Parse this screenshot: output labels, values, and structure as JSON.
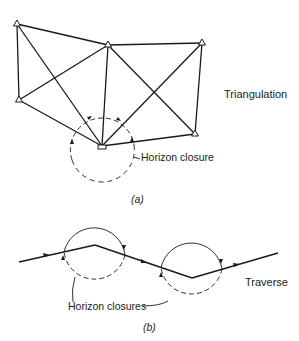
{
  "figure": {
    "part_a": {
      "caption": "(a)",
      "title": "Triangulation",
      "annotation": "Horizon closure",
      "stations": [
        {
          "id": "A",
          "x": 17,
          "y": 24
        },
        {
          "id": "B",
          "x": 108,
          "y": 45
        },
        {
          "id": "C",
          "x": 202,
          "y": 43
        },
        {
          "id": "D",
          "x": 19,
          "y": 100
        },
        {
          "id": "E",
          "x": 195,
          "y": 134
        },
        {
          "id": "F",
          "x": 102,
          "y": 146
        }
      ]
    },
    "part_b": {
      "caption": "(b)",
      "title": "Traverse",
      "annotation": "Horizon closures"
    },
    "colors": {
      "line": "#1a1a1a",
      "text": "#222222",
      "background": "#ffffff"
    }
  }
}
